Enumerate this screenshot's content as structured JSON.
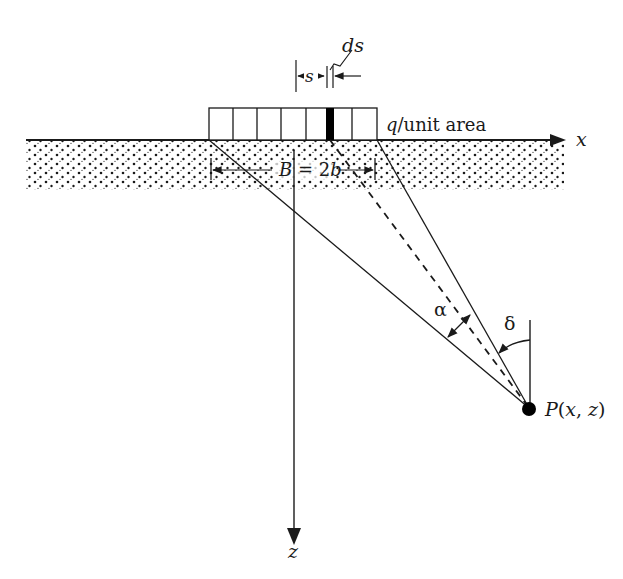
{
  "diagram": {
    "labels": {
      "ds": "ds",
      "s": "s",
      "load": "q/unit area",
      "load_q": "q",
      "load_rest": "/unit area",
      "x_axis": "x",
      "z_axis": "z",
      "width_B": "B",
      "width_eq": " = 2",
      "width_b": "b",
      "alpha": "α",
      "delta": "δ",
      "point_P": "P",
      "point_open": "(",
      "point_x": "x",
      "point_comma": ", ",
      "point_z": "z",
      "point_close": ")"
    },
    "colors": {
      "ink": "#1a1a1a",
      "background": "#ffffff",
      "element_fill": "#000000"
    },
    "strip": {
      "segments": 7,
      "shaded_segment": 5
    }
  }
}
